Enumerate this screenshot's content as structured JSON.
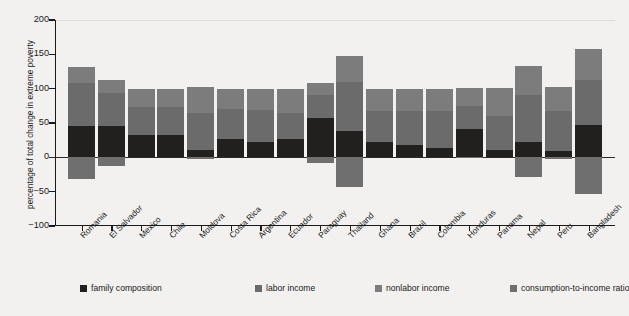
{
  "figure": {
    "y_axis_title": "percentage of total change in extreme poverty"
  },
  "chart_data": {
    "type": "bar",
    "subtype": "stacked-bar-with-negatives",
    "title": "",
    "xlabel": "",
    "ylabel": "percentage of total change in extreme poverty",
    "ylim": [
      -100,
      200
    ],
    "yticks": [
      -100,
      -50,
      0,
      50,
      100,
      150,
      200
    ],
    "ytick_labels": [
      "−100",
      "−50",
      "0",
      "50",
      "100",
      "150",
      "200"
    ],
    "grid": false,
    "legend_position": "bottom",
    "categories": [
      "Romania",
      "El Salvador",
      "Mexico",
      "Chile",
      "Moldova",
      "Costa Rica",
      "Argentina",
      "Ecuador",
      "Paraguay",
      "Thailand",
      "Ghana",
      "Brazil",
      "Colombia",
      "Honduras",
      "Panama",
      "Nepal",
      "Peru",
      "Bangladesh"
    ],
    "series": [
      {
        "name": "family composition",
        "color": "#221f1f",
        "values": [
          46,
          45,
          33,
          33,
          10,
          27,
          22,
          26,
          57,
          39,
          23,
          18,
          13,
          41,
          11,
          22,
          9,
          47
        ]
      },
      {
        "name": "labor income",
        "color": "#6b6b6b",
        "values": [
          62,
          48,
          41,
          40,
          54,
          44,
          47,
          39,
          34,
          70,
          45,
          49,
          54,
          34,
          49,
          69,
          58,
          66
        ]
      },
      {
        "name": "nonlabor income",
        "color": "#7c7c7c",
        "values": [
          23,
          19,
          26,
          27,
          38,
          29,
          31,
          35,
          17,
          39,
          32,
          33,
          33,
          26,
          41,
          42,
          36,
          45
        ]
      },
      {
        "name": "consumption-to-income ratio",
        "color": "#6f6f6f",
        "values": [
          -31,
          -13,
          0,
          0,
          -2,
          0,
          0,
          0,
          -8,
          -43,
          0,
          0,
          0,
          -1,
          0,
          -28,
          -3,
          -53
        ]
      }
    ],
    "bar_totals_positive": [
      131,
      112,
      100,
      100,
      102,
      100,
      100,
      100,
      108,
      148,
      100,
      100,
      100,
      101,
      101,
      133,
      103,
      158
    ],
    "bar_totals_negative": [
      -31,
      -13,
      0,
      0,
      -2,
      0,
      0,
      0,
      -8,
      -43,
      0,
      0,
      0,
      -1,
      0,
      -28,
      -3,
      -53
    ]
  },
  "legend": {
    "items": [
      {
        "label": "family composition",
        "color": "#221f1f"
      },
      {
        "label": "labor income",
        "color": "#6b6b6b"
      },
      {
        "label": "nonlabor income",
        "color": "#7c7c7c"
      },
      {
        "label": "consumption-to-income ratio",
        "color": "#6f6f6f"
      }
    ]
  }
}
